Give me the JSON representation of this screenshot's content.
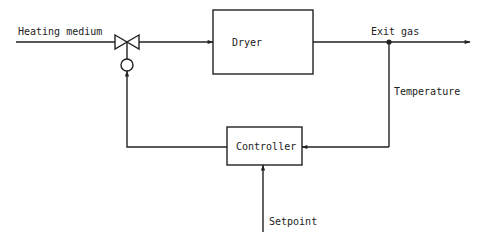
{
  "diagram": {
    "type": "feedback control loop",
    "labels": {
      "heating_medium": "Heating medium",
      "dryer": "Dryer",
      "exit_gas": "Exit gas",
      "temperature": "Temperature",
      "controller": "Controller",
      "setpoint": "Setpoint"
    },
    "colors": {
      "line": "#222222",
      "background": "#ffffff"
    },
    "nodes": [
      {
        "id": "valve",
        "kind": "control-valve-with-actuator"
      },
      {
        "id": "dryer",
        "kind": "process-block",
        "label": "Dryer"
      },
      {
        "id": "controller",
        "kind": "controller-block",
        "label": "Controller"
      },
      {
        "id": "sensor-junction",
        "kind": "junction-dot"
      }
    ],
    "edges": [
      {
        "from": "heating-medium-inlet",
        "to": "valve"
      },
      {
        "from": "valve",
        "to": "dryer"
      },
      {
        "from": "dryer",
        "to": "exit-gas-outlet"
      },
      {
        "from": "sensor-junction",
        "to": "controller",
        "label": "Temperature"
      },
      {
        "from": "setpoint-input",
        "to": "controller",
        "label": "Setpoint"
      },
      {
        "from": "controller",
        "to": "valve"
      }
    ]
  }
}
